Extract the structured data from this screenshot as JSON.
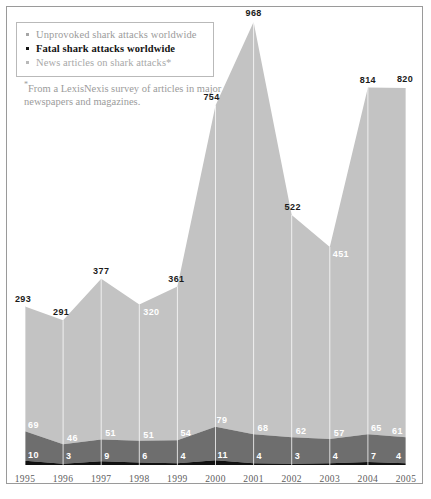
{
  "legend": {
    "items": [
      {
        "label": "Unprovoked shark attacks worldwide",
        "key": "unprovoked",
        "color": "#a6a6a6"
      },
      {
        "label": "Fatal shark attacks worldwide",
        "key": "fatal",
        "color": "#141414"
      },
      {
        "label": "News articles on shark attacks*",
        "key": "news",
        "color": "#b9b9b9"
      }
    ]
  },
  "footnote": {
    "marker": "*",
    "text": "From a LexisNexis survey of articles in major newspapers and magazines."
  },
  "chart_data": {
    "type": "area",
    "stacked": true,
    "title": "",
    "subtitle": "",
    "xlabel": "",
    "ylabel": "",
    "grid": "vertical-only",
    "legend_position": "top-left",
    "categories": [
      "1995",
      "1996",
      "1997",
      "1998",
      "1999",
      "2000",
      "2001",
      "2002",
      "2003",
      "2004",
      "2005"
    ],
    "ylim": [
      0,
      1043
    ],
    "series": [
      {
        "name": "Fatal shark attacks worldwide",
        "color": "#111111",
        "stack_order": 1,
        "values": [
          10,
          3,
          9,
          6,
          4,
          11,
          4,
          3,
          4,
          7,
          4
        ],
        "label_style": [
          "light",
          "light",
          "light",
          "light",
          "light",
          "light",
          "light",
          "light",
          "light",
          "light",
          "light"
        ]
      },
      {
        "name": "Unprovoked shark attacks worldwide",
        "color": "#6e6e6e",
        "stack_order": 2,
        "values": [
          69,
          46,
          51,
          51,
          54,
          79,
          68,
          62,
          57,
          65,
          61
        ],
        "label_style": [
          "light",
          "light",
          "light",
          "light",
          "light",
          "light",
          "light",
          "light",
          "light",
          "light",
          "light"
        ]
      },
      {
        "name": "News articles on shark attacks*",
        "color": "#c3c3c3",
        "stack_order": 3,
        "values": [
          293,
          291,
          377,
          320,
          361,
          754,
          968,
          522,
          451,
          814,
          820
        ],
        "label_style": [
          "dark",
          "dark",
          "dark",
          "light",
          "dark",
          "dark",
          "dark",
          "dark",
          "light",
          "dark",
          "dark"
        ]
      }
    ]
  },
  "colors": {
    "news_band": "#c3c3c3",
    "unprovoked_band": "#6e6e6e",
    "fatal_band": "#111111",
    "gridline": "#ffffff",
    "frame": "#9a9a9a",
    "background": "#ffffff"
  }
}
